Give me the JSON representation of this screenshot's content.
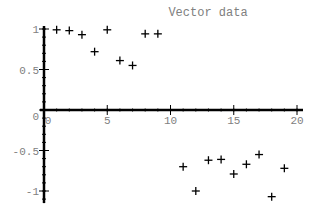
{
  "chart_data": {
    "type": "scatter",
    "title": "Vector data",
    "xlabel": "",
    "ylabel": "",
    "xlim": [
      0,
      20
    ],
    "ylim": [
      -1.1,
      1
    ],
    "x_ticks": [
      "0",
      "5",
      "10",
      "15",
      "20"
    ],
    "y_ticks": [
      "1",
      "0.5",
      "0",
      "-0.5",
      "-1"
    ],
    "grid": false,
    "marker": "+",
    "series": [
      {
        "name": "Vector data",
        "x": [
          1,
          2,
          3,
          4,
          5,
          6,
          7,
          8,
          9,
          11,
          12,
          13,
          14,
          15,
          16,
          17,
          18,
          19
        ],
        "y": [
          0.99,
          0.98,
          0.93,
          0.72,
          0.99,
          0.61,
          0.55,
          0.94,
          0.94,
          -0.7,
          -1.0,
          -0.62,
          -0.61,
          -0.79,
          -0.67,
          -0.55,
          -1.07,
          -0.72
        ]
      }
    ]
  }
}
